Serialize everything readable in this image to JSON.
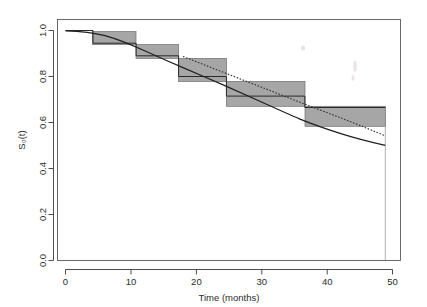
{
  "figure": {
    "name": "survival-function-plot",
    "background": "#ffffff"
  },
  "axes": {
    "x": {
      "label": "Time (months)",
      "ticks": [
        0,
        10,
        20,
        30,
        40,
        50
      ],
      "tick_labels": [
        "0",
        "10",
        "20",
        "30",
        "40",
        "50"
      ],
      "range": [
        -1.5,
        53
      ]
    },
    "y": {
      "label": "S₀(t)",
      "ticks": [
        0.0,
        0.2,
        0.4,
        0.6,
        0.8,
        1.0
      ],
      "tick_labels": [
        "0.0",
        "0.2",
        "0.4",
        "0.6",
        "0.8",
        "1.0"
      ],
      "range": [
        -0.02,
        1.04
      ]
    }
  },
  "chart_data": {
    "type": "line",
    "title": "",
    "xlabel": "Time (months)",
    "ylabel": "S₀(t)",
    "xlim": [
      -1.5,
      53
    ],
    "ylim": [
      -0.02,
      1.04
    ],
    "grid": false,
    "legend": "none",
    "series": [
      {
        "name": "Kaplan-Meier step estimate",
        "style": "step",
        "color": "#2a2a2a",
        "x": [
          0.0,
          4.2,
          10.8,
          17.3,
          24.6,
          36.6,
          48.9
        ],
        "y": [
          1.0,
          0.945,
          0.89,
          0.8,
          0.715,
          0.665,
          0.665
        ]
      },
      {
        "name": "Pointwise confidence band (shaded rectangles)",
        "style": "rect-band",
        "color": "#9e9e9e",
        "rects": [
          {
            "x0": 4.2,
            "x1": 10.8,
            "y_low": 0.915,
            "y_high": 0.972
          },
          {
            "x0": 10.8,
            "x1": 17.3,
            "y_low": 0.855,
            "y_high": 0.915
          },
          {
            "x0": 17.3,
            "x1": 24.6,
            "y_low": 0.755,
            "y_high": 0.855
          },
          {
            "x0": 24.6,
            "x1": 36.6,
            "y_low": 0.647,
            "y_high": 0.755
          },
          {
            "x0": 36.6,
            "x1": 48.9,
            "y_low": 0.56,
            "y_high": 0.647
          }
        ]
      },
      {
        "name": "Fitted parametric survival curve (solid)",
        "style": "solid",
        "color": "#202020",
        "x": [
          0,
          2,
          4,
          6,
          8,
          10,
          12,
          14,
          16,
          18,
          20,
          22,
          24,
          26,
          28,
          30,
          32,
          34,
          36,
          38,
          40,
          42,
          44,
          46,
          48.9
        ],
        "y": [
          0.998,
          0.996,
          0.992,
          0.984,
          0.973,
          0.96,
          0.944,
          0.927,
          0.909,
          0.89,
          0.871,
          0.851,
          0.831,
          0.81,
          0.789,
          0.768,
          0.746,
          0.723,
          0.7,
          0.676,
          0.651,
          0.625,
          0.598,
          0.572,
          0.547
        ]
      },
      {
        "name": "Fitted parametric survival curve (dotted)",
        "style": "dotted",
        "color": "#303030",
        "x": [
          18,
          20,
          22,
          24,
          26,
          28,
          30,
          32,
          34,
          36,
          38,
          40,
          42,
          44,
          46,
          48.9
        ],
        "y": [
          0.884,
          0.862,
          0.84,
          0.818,
          0.796,
          0.774,
          0.752,
          0.73,
          0.708,
          0.686,
          0.664,
          0.642,
          0.62,
          0.598,
          0.576,
          0.545
        ]
      },
      {
        "name": "Terminal vertical drop line",
        "style": "vline",
        "color": "#8f8f8f",
        "x": 48.9,
        "y_from": 0.56,
        "y_to": 0.0
      }
    ]
  }
}
